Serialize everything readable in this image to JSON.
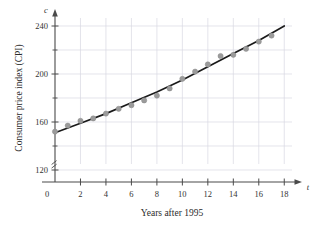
{
  "chart_data": {
    "type": "scatter",
    "title": "",
    "xlabel": "Years after 1995",
    "ylabel": "Consumer price index (CPI)",
    "x_axis_variable": "t",
    "y_axis_variable": "c",
    "xlim": [
      0,
      19
    ],
    "ylim": [
      110,
      250
    ],
    "y_axis_break": true,
    "grid": true,
    "legend": "none",
    "xticks": [
      0,
      2,
      4,
      6,
      8,
      10,
      12,
      14,
      16,
      18
    ],
    "xtick_labels": [
      "0",
      "2",
      "4",
      "6",
      "8",
      "10",
      "12",
      "14",
      "16",
      "18"
    ],
    "x_minor_ticks": [
      1,
      3,
      5,
      7,
      9,
      11,
      13,
      15,
      17
    ],
    "yticks": [
      120,
      160,
      200,
      240
    ],
    "ytick_labels": [
      "120",
      "160",
      "200",
      "240"
    ],
    "y_minor_ticks": [
      140,
      180,
      220
    ],
    "x": [
      0,
      1,
      2,
      3,
      4,
      5,
      6,
      7,
      8,
      9,
      10,
      11,
      12,
      13,
      14,
      15,
      16,
      17
    ],
    "values": [
      152,
      157,
      161,
      163,
      167,
      171,
      174,
      178,
      182,
      188,
      196,
      202,
      208,
      215,
      216,
      221,
      227,
      232
    ],
    "series": [
      {
        "name": "CPI data points",
        "marker": "circle",
        "color": "#9b9b9b",
        "values": [
          152,
          157,
          161,
          163,
          167,
          171,
          174,
          178,
          182,
          188,
          196,
          202,
          208,
          215,
          216,
          221,
          227,
          232
        ]
      },
      {
        "name": "fitted curve",
        "type": "line",
        "color": "#1a1a1a",
        "x": [
          0,
          2,
          4,
          6,
          8,
          10,
          12,
          14,
          16,
          18
        ],
        "values": [
          151,
          159,
          167,
          176,
          185,
          195,
          206,
          217,
          228,
          240
        ]
      }
    ],
    "grid_color": "#d8d8e2",
    "axis_color": "#4a4a4a",
    "marker_color": "#9b9b9b",
    "curve_color": "#1a1a1a"
  }
}
